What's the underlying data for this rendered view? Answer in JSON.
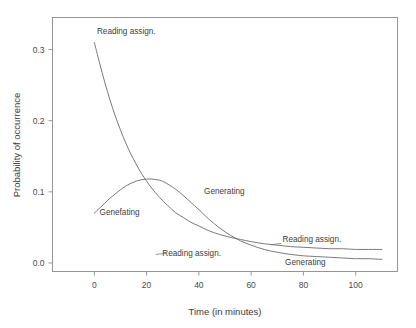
{
  "chart_data": {
    "type": "line",
    "title": "",
    "xlabel": "Time (in minutes)",
    "ylabel": "Probability of occurrence",
    "xlim": [
      -16,
      116
    ],
    "ylim": [
      -0.012,
      0.345
    ],
    "xticks": [
      0,
      20,
      40,
      60,
      80,
      100
    ],
    "xticklabels": [
      "0",
      "20",
      "40",
      "60",
      "80",
      "100"
    ],
    "yticks": [
      0.0,
      0.1,
      0.2,
      0.3
    ],
    "yticklabels": [
      "0.0",
      "0.1",
      "0.2",
      "0.3"
    ],
    "grid": false,
    "legend": "inline-annotations",
    "series": [
      {
        "name": "Reading assign.",
        "shape": "exponential-decay-with-plateau",
        "x": [
          0,
          2,
          4,
          6,
          8,
          10,
          12,
          14,
          16,
          18,
          20,
          22,
          25,
          28,
          31,
          34,
          37,
          40,
          44,
          48,
          52,
          56,
          60,
          65,
          70,
          75,
          80,
          85,
          90,
          95,
          100,
          105,
          110
        ],
        "y": [
          0.31,
          0.281,
          0.254,
          0.229,
          0.207,
          0.187,
          0.169,
          0.153,
          0.139,
          0.126,
          0.115,
          0.105,
          0.092,
          0.081,
          0.071,
          0.064,
          0.057,
          0.052,
          0.045,
          0.04,
          0.036,
          0.033,
          0.03,
          0.027,
          0.025,
          0.023,
          0.022,
          0.021,
          0.02,
          0.02,
          0.019,
          0.019,
          0.019
        ]
      },
      {
        "name": "Generating",
        "shape": "skewed-unimodal-hump",
        "peak_x": 22,
        "peak_y": 0.118,
        "x": [
          0,
          2,
          4,
          6,
          8,
          10,
          12,
          14,
          16,
          18,
          20,
          22,
          24,
          26,
          28,
          31,
          34,
          37,
          40,
          44,
          48,
          52,
          56,
          60,
          65,
          70,
          75,
          80,
          85,
          90,
          95,
          100,
          105,
          110
        ],
        "y": [
          0.07,
          0.077,
          0.084,
          0.091,
          0.097,
          0.103,
          0.108,
          0.112,
          0.115,
          0.117,
          0.118,
          0.118,
          0.117,
          0.115,
          0.111,
          0.104,
          0.095,
          0.085,
          0.075,
          0.061,
          0.049,
          0.039,
          0.031,
          0.025,
          0.019,
          0.015,
          0.012,
          0.01,
          0.009,
          0.008,
          0.007,
          0.006,
          0.006,
          0.005
        ]
      }
    ],
    "annotations": [
      {
        "text": "Reading assign.",
        "x": 1,
        "y": 0.322,
        "series": "Reading assign.",
        "anchor": "start"
      },
      {
        "text": "Genefating",
        "x": 2,
        "y": 0.068,
        "series": "Generating",
        "anchor": "start"
      },
      {
        "text": "Generating",
        "x": 42,
        "y": 0.097,
        "series": "Generating",
        "anchor": "start"
      },
      {
        "text": "Reading assign.",
        "x": 26,
        "y": 0.01,
        "series": "Reading assign.",
        "anchor": "start"
      },
      {
        "text": "Reading assign.",
        "x": 72,
        "y": 0.029,
        "series": "Reading assign.",
        "anchor": "start"
      },
      {
        "text": "Generating",
        "x": 73,
        "y": -0.003,
        "series": "Generating",
        "anchor": "start"
      }
    ]
  },
  "colors": {
    "background": "#ffffff",
    "frame": "#8c8c8c",
    "curve": "#6b6b6b",
    "text": "#3a3a3a"
  }
}
